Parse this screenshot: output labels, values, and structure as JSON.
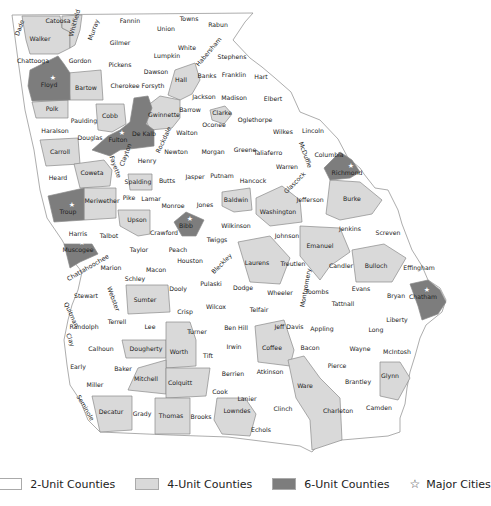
{
  "map": {
    "title": "Georgia counties by unit allocation",
    "colors": {
      "two_unit": "#ffffff",
      "four_unit": "#d9d9d9",
      "six_unit": "#7d7d7d",
      "border": "#8a8a8a"
    },
    "counties": [
      {
        "name": "Dade",
        "tier": 2,
        "x": 20,
        "y": 28,
        "rot": -70
      },
      {
        "name": "Catoosa",
        "tier": 2,
        "x": 58,
        "y": 21
      },
      {
        "name": "Walker",
        "tier": 4,
        "x": 40,
        "y": 39
      },
      {
        "name": "Whitfield",
        "tier": 4,
        "x": 75,
        "y": 23,
        "rot": -75
      },
      {
        "name": "Murray",
        "tier": 2,
        "x": 94,
        "y": 30,
        "rot": -70
      },
      {
        "name": "Fannin",
        "tier": 2,
        "x": 130,
        "y": 21
      },
      {
        "name": "Union",
        "tier": 2,
        "x": 166,
        "y": 29
      },
      {
        "name": "Towns",
        "tier": 2,
        "x": 189,
        "y": 19
      },
      {
        "name": "Rabun",
        "tier": 2,
        "x": 218,
        "y": 25
      },
      {
        "name": "Gilmer",
        "tier": 2,
        "x": 120,
        "y": 43
      },
      {
        "name": "Lumpkin",
        "tier": 2,
        "x": 167,
        "y": 56
      },
      {
        "name": "White",
        "tier": 2,
        "x": 187,
        "y": 48
      },
      {
        "name": "Habersham",
        "tier": 2,
        "x": 209,
        "y": 52,
        "rot": -50
      },
      {
        "name": "Stephens",
        "tier": 2,
        "x": 232,
        "y": 57
      },
      {
        "name": "Chattooga",
        "tier": 2,
        "x": 33,
        "y": 61
      },
      {
        "name": "Gordon",
        "tier": 2,
        "x": 80,
        "y": 61
      },
      {
        "name": "Pickens",
        "tier": 2,
        "x": 120,
        "y": 65
      },
      {
        "name": "Dawson",
        "tier": 2,
        "x": 156,
        "y": 72
      },
      {
        "name": "Hall",
        "tier": 4,
        "x": 181,
        "y": 80
      },
      {
        "name": "Banks",
        "tier": 2,
        "x": 207,
        "y": 76
      },
      {
        "name": "Franklin",
        "tier": 2,
        "x": 234,
        "y": 75
      },
      {
        "name": "Hart",
        "tier": 2,
        "x": 261,
        "y": 77
      },
      {
        "name": "Floyd",
        "tier": 6,
        "x": 49,
        "y": 85,
        "star": true
      },
      {
        "name": "Bartow",
        "tier": 4,
        "x": 86,
        "y": 88
      },
      {
        "name": "Cherokee",
        "tier": 2,
        "x": 125,
        "y": 86
      },
      {
        "name": "Forsyth",
        "tier": 2,
        "x": 153,
        "y": 86
      },
      {
        "name": "Jackson",
        "tier": 2,
        "x": 204,
        "y": 97
      },
      {
        "name": "Madison",
        "tier": 2,
        "x": 234,
        "y": 98
      },
      {
        "name": "Elbert",
        "tier": 2,
        "x": 273,
        "y": 99
      },
      {
        "name": "Polk",
        "tier": 4,
        "x": 52,
        "y": 109
      },
      {
        "name": "Paulding",
        "tier": 2,
        "x": 84,
        "y": 121
      },
      {
        "name": "Cobb",
        "tier": 4,
        "x": 110,
        "y": 116
      },
      {
        "name": "Gwinnette",
        "tier": 4,
        "x": 164,
        "y": 115
      },
      {
        "name": "Barrow",
        "tier": 2,
        "x": 190,
        "y": 110
      },
      {
        "name": "Clarke",
        "tier": 4,
        "x": 222,
        "y": 113
      },
      {
        "name": "Oglethorpe",
        "tier": 2,
        "x": 255,
        "y": 120
      },
      {
        "name": "Oconee",
        "tier": 2,
        "x": 214,
        "y": 125
      },
      {
        "name": "Haralson",
        "tier": 2,
        "x": 55,
        "y": 131
      },
      {
        "name": "Douglas",
        "tier": 2,
        "x": 90,
        "y": 138
      },
      {
        "name": "Fulton",
        "tier": 6,
        "x": 118,
        "y": 140,
        "star": true
      },
      {
        "name": "De Kalb",
        "tier": 6,
        "x": 144,
        "y": 134
      },
      {
        "name": "Rockdale",
        "tier": 2,
        "x": 164,
        "y": 140,
        "rot": -65
      },
      {
        "name": "Walton",
        "tier": 2,
        "x": 187,
        "y": 133
      },
      {
        "name": "Wilkes",
        "tier": 2,
        "x": 283,
        "y": 132
      },
      {
        "name": "Lincoln",
        "tier": 2,
        "x": 313,
        "y": 131
      },
      {
        "name": "Carroll",
        "tier": 4,
        "x": 60,
        "y": 152
      },
      {
        "name": "Clayton",
        "tier": 2,
        "x": 126,
        "y": 155,
        "rot": -70
      },
      {
        "name": "Henry",
        "tier": 2,
        "x": 147,
        "y": 161
      },
      {
        "name": "Newton",
        "tier": 2,
        "x": 176,
        "y": 152
      },
      {
        "name": "Morgan",
        "tier": 2,
        "x": 213,
        "y": 152
      },
      {
        "name": "Greene",
        "tier": 2,
        "x": 245,
        "y": 150
      },
      {
        "name": "Taliaferro",
        "tier": 2,
        "x": 268,
        "y": 153
      },
      {
        "name": "McDuffie",
        "tier": 2,
        "x": 305,
        "y": 155,
        "rot": 70
      },
      {
        "name": "Columbia",
        "tier": 2,
        "x": 329,
        "y": 155
      },
      {
        "name": "Fayette",
        "tier": 2,
        "x": 115,
        "y": 167,
        "rot": 70
      },
      {
        "name": "Coweta",
        "tier": 4,
        "x": 92,
        "y": 173
      },
      {
        "name": "Heard",
        "tier": 2,
        "x": 58,
        "y": 178
      },
      {
        "name": "Spalding",
        "tier": 4,
        "x": 138,
        "y": 182
      },
      {
        "name": "Butts",
        "tier": 2,
        "x": 167,
        "y": 181
      },
      {
        "name": "Jasper",
        "tier": 2,
        "x": 195,
        "y": 177
      },
      {
        "name": "Putnam",
        "tier": 2,
        "x": 222,
        "y": 176
      },
      {
        "name": "Hancock",
        "tier": 2,
        "x": 253,
        "y": 181
      },
      {
        "name": "Warren",
        "tier": 2,
        "x": 287,
        "y": 167
      },
      {
        "name": "Richmond",
        "tier": 6,
        "x": 347,
        "y": 173,
        "star": true
      },
      {
        "name": "Glascock",
        "tier": 2,
        "x": 295,
        "y": 183,
        "rot": -45
      },
      {
        "name": "Troup",
        "tier": 6,
        "x": 68,
        "y": 212,
        "star": true
      },
      {
        "name": "Meriwether",
        "tier": 4,
        "x": 102,
        "y": 201
      },
      {
        "name": "Pike",
        "tier": 2,
        "x": 129,
        "y": 198
      },
      {
        "name": "Lamar",
        "tier": 2,
        "x": 151,
        "y": 199
      },
      {
        "name": "Monroe",
        "tier": 2,
        "x": 173,
        "y": 206
      },
      {
        "name": "Jones",
        "tier": 2,
        "x": 205,
        "y": 205
      },
      {
        "name": "Baldwin",
        "tier": 4,
        "x": 236,
        "y": 200
      },
      {
        "name": "Washington",
        "tier": 4,
        "x": 278,
        "y": 212
      },
      {
        "name": "Jefferson",
        "tier": 2,
        "x": 310,
        "y": 200
      },
      {
        "name": "Burke",
        "tier": 4,
        "x": 352,
        "y": 199
      },
      {
        "name": "Upson",
        "tier": 4,
        "x": 137,
        "y": 220
      },
      {
        "name": "Bibb",
        "tier": 6,
        "x": 186,
        "y": 226,
        "star": true
      },
      {
        "name": "Wilkinson",
        "tier": 2,
        "x": 236,
        "y": 226
      },
      {
        "name": "Johnson",
        "tier": 2,
        "x": 287,
        "y": 236
      },
      {
        "name": "Jenkins",
        "tier": 2,
        "x": 350,
        "y": 229
      },
      {
        "name": "Screven",
        "tier": 2,
        "x": 388,
        "y": 233
      },
      {
        "name": "Harris",
        "tier": 2,
        "x": 78,
        "y": 234
      },
      {
        "name": "Talbot",
        "tier": 2,
        "x": 109,
        "y": 236
      },
      {
        "name": "Crawford",
        "tier": 2,
        "x": 164,
        "y": 233
      },
      {
        "name": "Twiggs",
        "tier": 2,
        "x": 217,
        "y": 240
      },
      {
        "name": "Muscogee",
        "tier": 6,
        "x": 78,
        "y": 250,
        "star": true
      },
      {
        "name": "Taylor",
        "tier": 2,
        "x": 139,
        "y": 250
      },
      {
        "name": "Peach",
        "tier": 2,
        "x": 178,
        "y": 250
      },
      {
        "name": "Emanuel",
        "tier": 4,
        "x": 320,
        "y": 246
      },
      {
        "name": "Laurens",
        "tier": 4,
        "x": 257,
        "y": 263
      },
      {
        "name": "Treutlen",
        "tier": 2,
        "x": 293,
        "y": 264
      },
      {
        "name": "Candler",
        "tier": 2,
        "x": 341,
        "y": 266
      },
      {
        "name": "Bulloch",
        "tier": 4,
        "x": 376,
        "y": 266
      },
      {
        "name": "Effingham",
        "tier": 2,
        "x": 419,
        "y": 268
      },
      {
        "name": "Chattahoochee",
        "tier": 2,
        "x": 88,
        "y": 268,
        "rot": -30
      },
      {
        "name": "Marion",
        "tier": 2,
        "x": 111,
        "y": 268
      },
      {
        "name": "Macon",
        "tier": 2,
        "x": 156,
        "y": 270
      },
      {
        "name": "Houston",
        "tier": 2,
        "x": 190,
        "y": 261
      },
      {
        "name": "Bleckley",
        "tier": 2,
        "x": 222,
        "y": 264,
        "rot": -45
      },
      {
        "name": "Schley",
        "tier": 2,
        "x": 135,
        "y": 279
      },
      {
        "name": "Montgomery",
        "tier": 2,
        "x": 306,
        "y": 288,
        "rot": -80
      },
      {
        "name": "Stewart",
        "tier": 2,
        "x": 86,
        "y": 296
      },
      {
        "name": "Webster",
        "tier": 2,
        "x": 113,
        "y": 299,
        "rot": 70
      },
      {
        "name": "Sumter",
        "tier": 4,
        "x": 145,
        "y": 300
      },
      {
        "name": "Dooly",
        "tier": 2,
        "x": 178,
        "y": 289
      },
      {
        "name": "Pulaski",
        "tier": 2,
        "x": 211,
        "y": 284
      },
      {
        "name": "Dodge",
        "tier": 2,
        "x": 243,
        "y": 288
      },
      {
        "name": "Wheeler",
        "tier": 2,
        "x": 280,
        "y": 293
      },
      {
        "name": "Toombs",
        "tier": 2,
        "x": 317,
        "y": 292
      },
      {
        "name": "Evans",
        "tier": 2,
        "x": 361,
        "y": 289
      },
      {
        "name": "Bryan",
        "tier": 2,
        "x": 396,
        "y": 296
      },
      {
        "name": "Chatham",
        "tier": 6,
        "x": 423,
        "y": 297,
        "star": true
      },
      {
        "name": "Quitman",
        "tier": 2,
        "x": 71,
        "y": 315,
        "rot": 65
      },
      {
        "name": "Randolph",
        "tier": 2,
        "x": 84,
        "y": 327
      },
      {
        "name": "Terrell",
        "tier": 2,
        "x": 117,
        "y": 322
      },
      {
        "name": "Lee",
        "tier": 2,
        "x": 150,
        "y": 327
      },
      {
        "name": "Crisp",
        "tier": 2,
        "x": 185,
        "y": 312
      },
      {
        "name": "Wilcox",
        "tier": 2,
        "x": 216,
        "y": 307
      },
      {
        "name": "Telfair",
        "tier": 2,
        "x": 259,
        "y": 310
      },
      {
        "name": "Tattnall",
        "tier": 2,
        "x": 343,
        "y": 304
      },
      {
        "name": "Liberty",
        "tier": 2,
        "x": 397,
        "y": 320
      },
      {
        "name": "Clay",
        "tier": 2,
        "x": 70,
        "y": 340,
        "rot": 70
      },
      {
        "name": "Ben Hill",
        "tier": 2,
        "x": 236,
        "y": 328
      },
      {
        "name": "Turner",
        "tier": 2,
        "x": 197,
        "y": 332
      },
      {
        "name": "Jeff Davis",
        "tier": 2,
        "x": 289,
        "y": 327
      },
      {
        "name": "Appling",
        "tier": 2,
        "x": 322,
        "y": 329
      },
      {
        "name": "Long",
        "tier": 2,
        "x": 376,
        "y": 330
      },
      {
        "name": "Calhoun",
        "tier": 2,
        "x": 101,
        "y": 349
      },
      {
        "name": "Dougherty",
        "tier": 4,
        "x": 146,
        "y": 349
      },
      {
        "name": "Worth",
        "tier": 4,
        "x": 179,
        "y": 352
      },
      {
        "name": "Irwin",
        "tier": 2,
        "x": 234,
        "y": 347
      },
      {
        "name": "Coffee",
        "tier": 4,
        "x": 272,
        "y": 348
      },
      {
        "name": "Bacon",
        "tier": 2,
        "x": 310,
        "y": 348
      },
      {
        "name": "Wayne",
        "tier": 2,
        "x": 360,
        "y": 349
      },
      {
        "name": "McIntosh",
        "tier": 2,
        "x": 397,
        "y": 352
      },
      {
        "name": "Tift",
        "tier": 2,
        "x": 208,
        "y": 356
      },
      {
        "name": "Early",
        "tier": 2,
        "x": 78,
        "y": 367
      },
      {
        "name": "Baker",
        "tier": 2,
        "x": 123,
        "y": 369
      },
      {
        "name": "Pierce",
        "tier": 2,
        "x": 337,
        "y": 366
      },
      {
        "name": "Miller",
        "tier": 2,
        "x": 95,
        "y": 385
      },
      {
        "name": "Mitchell",
        "tier": 4,
        "x": 146,
        "y": 379
      },
      {
        "name": "Colquitt",
        "tier": 4,
        "x": 180,
        "y": 383
      },
      {
        "name": "Berrien",
        "tier": 2,
        "x": 233,
        "y": 374
      },
      {
        "name": "Atkinson",
        "tier": 2,
        "x": 270,
        "y": 372
      },
      {
        "name": "Ware",
        "tier": 4,
        "x": 305,
        "y": 386
      },
      {
        "name": "Brantley",
        "tier": 2,
        "x": 358,
        "y": 382
      },
      {
        "name": "Glynn",
        "tier": 4,
        "x": 390,
        "y": 376
      },
      {
        "name": "Seminole",
        "tier": 2,
        "x": 85,
        "y": 408,
        "rot": 60
      },
      {
        "name": "Cook",
        "tier": 2,
        "x": 220,
        "y": 392
      },
      {
        "name": "Lanier",
        "tier": 2,
        "x": 247,
        "y": 399
      },
      {
        "name": "Clinch",
        "tier": 2,
        "x": 283,
        "y": 409
      },
      {
        "name": "Charleton",
        "tier": 2,
        "x": 338,
        "y": 411
      },
      {
        "name": "Camden",
        "tier": 2,
        "x": 379,
        "y": 408
      },
      {
        "name": "Decatur",
        "tier": 4,
        "x": 111,
        "y": 412
      },
      {
        "name": "Grady",
        "tier": 2,
        "x": 142,
        "y": 414
      },
      {
        "name": "Thomas",
        "tier": 4,
        "x": 171,
        "y": 416
      },
      {
        "name": "Brooks",
        "tier": 2,
        "x": 201,
        "y": 417
      },
      {
        "name": "Lowndes",
        "tier": 4,
        "x": 237,
        "y": 411
      },
      {
        "name": "Echols",
        "tier": 2,
        "x": 261,
        "y": 430
      }
    ]
  },
  "legend": {
    "items": [
      {
        "label": "2-Unit Counties",
        "swatch": "#ffffff"
      },
      {
        "label": "4-Unit Counties",
        "swatch": "#d9d9d9"
      },
      {
        "label": "6-Unit Counties",
        "swatch": "#7d7d7d"
      },
      {
        "label": "Major Cities",
        "icon": "star-icon",
        "glyph": "☆"
      }
    ]
  }
}
